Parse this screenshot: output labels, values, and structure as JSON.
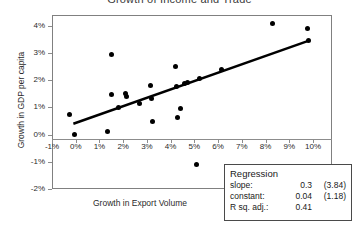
{
  "chart_data": {
    "type": "scatter",
    "title": "Growth of Income and Trade",
    "xlabel": "Growth in Export Volume",
    "ylabel": "Growth in GDP per capita",
    "xlim": [
      -1,
      10.8
    ],
    "ylim": [
      -2,
      4.4
    ],
    "grid": false,
    "legend_position": "bottom-right",
    "xticks": [
      "-1%",
      "0%",
      "1%",
      "2%",
      "3%",
      "4%",
      "5%",
      "6%",
      "7%",
      "8%",
      "9%",
      "10%"
    ],
    "xtick_values": [
      -1,
      0,
      1,
      2,
      3,
      4,
      5,
      6,
      7,
      8,
      9,
      10
    ],
    "yticks": [
      "4%",
      "3%",
      "2%",
      "1%",
      "0%",
      "-1%",
      "-2%"
    ],
    "ytick_values": [
      4,
      3,
      2,
      1,
      0,
      -1,
      -2
    ],
    "points": [
      {
        "x": -0.25,
        "y": 0.73
      },
      {
        "x": -0.05,
        "y": 0.0
      },
      {
        "x": 1.35,
        "y": 0.13
      },
      {
        "x": 1.5,
        "y": 2.95
      },
      {
        "x": 1.5,
        "y": 1.48
      },
      {
        "x": 1.8,
        "y": 1.0
      },
      {
        "x": 2.1,
        "y": 1.5
      },
      {
        "x": 2.15,
        "y": 1.42
      },
      {
        "x": 2.7,
        "y": 1.13
      },
      {
        "x": 3.15,
        "y": 1.82
      },
      {
        "x": 3.2,
        "y": 1.32
      },
      {
        "x": 3.25,
        "y": 0.47
      },
      {
        "x": 4.2,
        "y": 2.52
      },
      {
        "x": 4.25,
        "y": 1.77
      },
      {
        "x": 4.3,
        "y": 0.63
      },
      {
        "x": 4.4,
        "y": 0.97
      },
      {
        "x": 4.6,
        "y": 1.87
      },
      {
        "x": 4.7,
        "y": 1.9
      },
      {
        "x": 5.1,
        "y": -1.1
      },
      {
        "x": 5.2,
        "y": 2.07
      },
      {
        "x": 6.15,
        "y": 2.4
      },
      {
        "x": 8.3,
        "y": 4.07
      },
      {
        "x": 9.75,
        "y": 3.9
      },
      {
        "x": 9.8,
        "y": 3.47
      }
    ],
    "trend_line": {
      "x_start": -0.1,
      "y_start": 0.4,
      "x_end": 9.8,
      "y_end": 3.45
    }
  },
  "regression": {
    "title": "Regression",
    "rows": [
      {
        "key": "slope:",
        "value": "0.3",
        "stat": "(3.84)"
      },
      {
        "key": "constant:",
        "value": "0.04",
        "stat": "(1.18)"
      },
      {
        "key": "R sq. adj.:",
        "value": "0.41",
        "stat": ""
      }
    ]
  }
}
